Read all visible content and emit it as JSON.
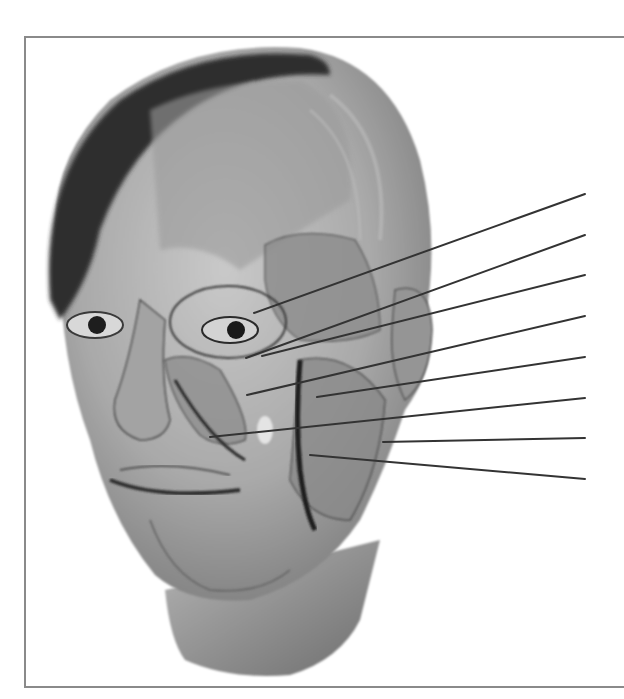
{
  "figure": {
    "label_lines": [
      {
        "id": 1,
        "from": [
          254,
          313
        ],
        "to": [
          585,
          194
        ],
        "label": ""
      },
      {
        "id": 2,
        "from": [
          246,
          358
        ],
        "to": [
          585,
          235
        ],
        "label": ""
      },
      {
        "id": 3,
        "from": [
          262,
          356
        ],
        "to": [
          585,
          275
        ],
        "label": ""
      },
      {
        "id": 4,
        "from": [
          247,
          395
        ],
        "to": [
          585,
          316
        ],
        "label": ""
      },
      {
        "id": 5,
        "from": [
          317,
          397
        ],
        "to": [
          585,
          357
        ],
        "label": ""
      },
      {
        "id": 6,
        "from": [
          210,
          437
        ],
        "to": [
          585,
          398
        ],
        "label": ""
      },
      {
        "id": 7,
        "from": [
          383,
          442
        ],
        "to": [
          585,
          438
        ],
        "label": ""
      },
      {
        "id": 8,
        "from": [
          310,
          455
        ],
        "to": [
          585,
          479
        ],
        "label": ""
      }
    ],
    "colors": {
      "line": "#333333",
      "frame": "#8a8a8a",
      "background": "#ffffff"
    }
  }
}
